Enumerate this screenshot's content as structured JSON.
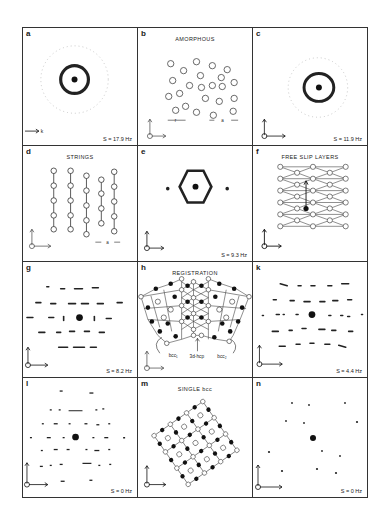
{
  "figure": {
    "panels": [
      {
        "id": "a",
        "letter": "a",
        "title": "",
        "freq": "S = 17.9 Hz",
        "type": "diffraction-ring",
        "axes": {
          "x": "k_x",
          "y": "k_y",
          "z": ""
        }
      },
      {
        "id": "b",
        "letter": "b",
        "title": "AMORPHOUS",
        "freq": "",
        "type": "real-space-amorphous",
        "axes": {
          "x": "x̂",
          "y": "ŷ",
          "z": "ẑ"
        },
        "labels": {
          "r": "r",
          "a": "a"
        }
      },
      {
        "id": "c",
        "letter": "c",
        "title": "",
        "freq": "S = 11.9 Hz",
        "type": "diffraction-ring",
        "axes": {
          "x": "k_x",
          "y": "k_y",
          "z": "k_z"
        }
      },
      {
        "id": "d",
        "letter": "d",
        "title": "STRINGS",
        "freq": "",
        "type": "real-space-strings",
        "axes": {
          "x": "x̂",
          "y": "ŷ",
          "z": "ẑ"
        },
        "labels": {
          "a": "a"
        }
      },
      {
        "id": "e",
        "letter": "e",
        "title": "",
        "freq": "S = 9.3 Hz",
        "type": "diffraction-hex",
        "axes": {
          "x": "k_x",
          "y": "k_y",
          "z": "k_z"
        }
      },
      {
        "id": "f",
        "letter": "f",
        "title": "FREE SLIP LAYERS",
        "freq": "",
        "type": "real-space-triangular",
        "axes": {
          "x": "x̂",
          "y": "ŷ",
          "z": "ẑ"
        }
      },
      {
        "id": "g",
        "letter": "g",
        "title": "",
        "freq": "S = 8.2 Hz",
        "type": "diffraction-streaks",
        "axes": {
          "x": "k_x",
          "y": "k_y",
          "z": "k_z"
        }
      },
      {
        "id": "h",
        "letter": "h",
        "title": "REGISTRATION",
        "freq": "",
        "type": "real-space-registration",
        "axes": {
          "x": "x̂",
          "y": "ŷ",
          "z": "ẑ"
        },
        "labels": {
          "bcc1": "bcc₁",
          "hcp": "3d-hcp",
          "bcc2": "bcc₂"
        }
      },
      {
        "id": "k",
        "letter": "k",
        "title": "",
        "freq": "S = 4.4 Hz",
        "type": "diffraction-streaks",
        "axes": {
          "x": "k_x",
          "y": "k_y",
          "z": "k_z"
        }
      },
      {
        "id": "l",
        "letter": "l",
        "title": "",
        "freq": "S = 0 Hz",
        "type": "diffraction-spots",
        "axes": {
          "x": "k_x",
          "y": "k_y",
          "z": "k_z"
        }
      },
      {
        "id": "m",
        "letter": "m",
        "title": "SINGLE bcc",
        "freq": "",
        "type": "real-space-bcc",
        "axes": {
          "x": "x̂",
          "y": "ŷ",
          "z": "ẑ"
        }
      },
      {
        "id": "n",
        "letter": "n",
        "title": "",
        "freq": "S = 0 Hz",
        "type": "diffraction-spots",
        "axes": {
          "x": "k_x",
          "y": "k_y",
          "z": "k_z"
        }
      }
    ]
  }
}
